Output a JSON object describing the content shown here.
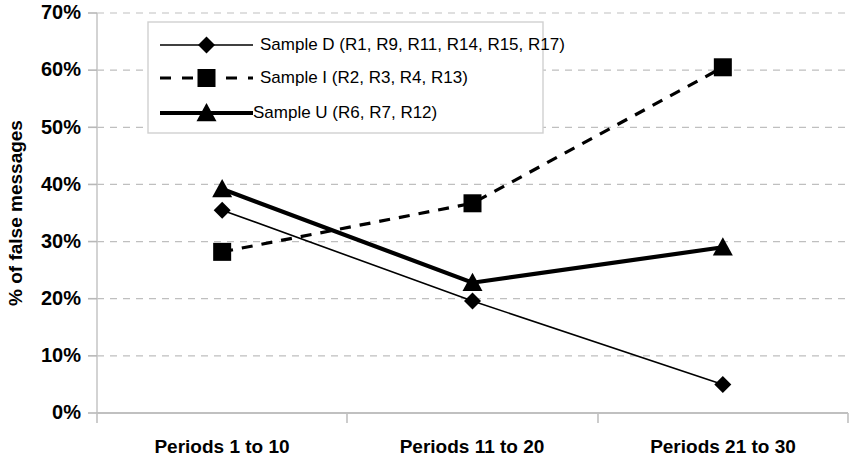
{
  "chart_data": {
    "type": "line",
    "title": "",
    "subtitle": "",
    "xlabel": "",
    "ylabel": "% of false messages",
    "categories": [
      "Periods 1 to 10",
      "Periods 11 to 20",
      "Periods 21 to 30"
    ],
    "ylim": [
      0,
      70
    ],
    "ytick_labels": [
      "0%",
      "10%",
      "20%",
      "30%",
      "40%",
      "50%",
      "60%",
      "70%"
    ],
    "ytick_values": [
      0,
      10,
      20,
      30,
      40,
      50,
      60,
      70
    ],
    "grid": true,
    "grid_style": "dashed",
    "grid_color": "#bfbfbf",
    "legend_position": "top-left-inside",
    "series": [
      {
        "name": "Sample D (R1, R9, R11, R14, R15, R17)",
        "marker": "diamond",
        "line_style": "solid",
        "line_width": 1.6,
        "color": "#000000",
        "values": [
          35.5,
          19.6,
          5.0
        ]
      },
      {
        "name": "Sample I (R2, R3, R4, R13)",
        "marker": "square",
        "line_style": "dashed",
        "line_width": 3.2,
        "color": "#000000",
        "values": [
          28.2,
          36.7,
          60.5
        ]
      },
      {
        "name": "Sample U (R6, R7, R12)",
        "marker": "triangle",
        "line_style": "solid",
        "line_width": 4.2,
        "color": "#000000",
        "values": [
          39.2,
          22.8,
          29.0
        ]
      }
    ]
  },
  "axes": {
    "y_axis_label": "% of false messages",
    "y_ticks": [
      {
        "label": "70%",
        "value": 70
      },
      {
        "label": "60%",
        "value": 60
      },
      {
        "label": "50%",
        "value": 50
      },
      {
        "label": "40%",
        "value": 40
      },
      {
        "label": "30%",
        "value": 30
      },
      {
        "label": "20%",
        "value": 20
      },
      {
        "label": "10%",
        "value": 10
      },
      {
        "label": "0%",
        "value": 0
      }
    ],
    "x_ticks": [
      {
        "label": "Periods 1 to 10"
      },
      {
        "label": "Periods 11 to 20"
      },
      {
        "label": "Periods 21 to 30"
      }
    ]
  },
  "legend": {
    "entries": [
      {
        "label": "Sample D (R1, R9, R11, R14, R15, R17)",
        "marker": "diamond",
        "line_style": "solid"
      },
      {
        "label": "Sample I (R2, R3, R4, R13)",
        "marker": "square",
        "line_style": "dashed"
      },
      {
        "label": "Sample U (R6, R7, R12)",
        "marker": "triangle",
        "line_style": "solid"
      }
    ]
  }
}
